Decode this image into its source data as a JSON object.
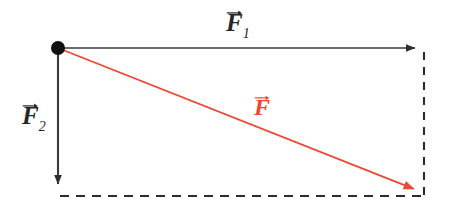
{
  "figure": {
    "background_color": "#ffffff",
    "width": 450,
    "height": 211
  },
  "labels": {
    "f1": {
      "symbol": "F",
      "subscript": "1",
      "color": "#252525",
      "text": "F⃗1"
    },
    "f2": {
      "symbol": "F",
      "subscript": "2",
      "color": "#252525",
      "text": "F⃗2"
    },
    "resultant": {
      "symbol": "F",
      "subscript": "",
      "color": "#ee4632",
      "text": "F⃗"
    }
  },
  "colors": {
    "stroke_dark": "#3a3a3a",
    "stroke_dashed": "#2b2b2b",
    "resultant_red": "#ee4632",
    "origin_dot": "#111111",
    "background": "#ffffff"
  },
  "chart_data": {
    "type": "scatter",
    "xlabel": "",
    "ylabel": "",
    "xlim": [
      0,
      450
    ],
    "ylim": [
      211,
      0
    ],
    "grid": false,
    "legend_position": "none",
    "origin": {
      "x": 58,
      "y": 48,
      "label": "origin"
    },
    "series": [
      {
        "name": "F⃗1",
        "kind": "arrow",
        "style": "solid",
        "color": "#3a3a3a",
        "from": {
          "x": 58,
          "y": 48
        },
        "to": {
          "x": 425,
          "y": 48
        },
        "components": {
          "dx": 367,
          "dy": 0
        },
        "magnitude_px": 367,
        "angle_deg": 0,
        "label": "F⃗1",
        "label_pos": {
          "x": 238,
          "y": 22
        }
      },
      {
        "name": "F⃗2",
        "kind": "arrow",
        "style": "solid",
        "color": "#3a3a3a",
        "from": {
          "x": 58,
          "y": 48
        },
        "to": {
          "x": 58,
          "y": 194
        },
        "components": {
          "dx": 0,
          "dy": 146
        },
        "magnitude_px": 146,
        "angle_deg": -90,
        "label": "F⃗2",
        "label_pos": {
          "x": 34,
          "y": 117
        }
      },
      {
        "name": "F⃗",
        "kind": "arrow",
        "style": "solid",
        "color": "#ee4632",
        "from": {
          "x": 58,
          "y": 48
        },
        "to": {
          "x": 424,
          "y": 193
        },
        "components": {
          "dx": 366,
          "dy": 145
        },
        "magnitude_px": 394,
        "angle_deg": -21.6,
        "label": "F⃗",
        "label_pos": {
          "x": 265,
          "y": 107
        }
      }
    ],
    "construction_lines": [
      {
        "name": "right-dashed-edge",
        "style": "dashed",
        "color": "#2b2b2b",
        "from": {
          "x": 424,
          "y": 50
        },
        "to": {
          "x": 424,
          "y": 197
        }
      },
      {
        "name": "bottom-dashed-edge",
        "style": "dashed",
        "color": "#2b2b2b",
        "from": {
          "x": 58,
          "y": 196
        },
        "to": {
          "x": 424,
          "y": 196
        }
      }
    ],
    "annotations": [
      {
        "name": "origin-point",
        "x": 58,
        "y": 48,
        "marker": "filled-circle",
        "radius_px": 7,
        "color": "#111111"
      }
    ]
  }
}
